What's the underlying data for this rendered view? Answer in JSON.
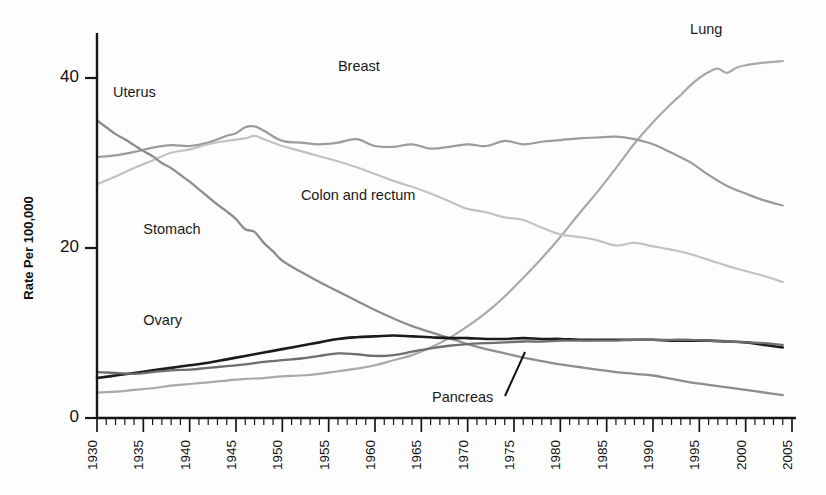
{
  "chart_data": {
    "type": "line",
    "title": "",
    "subtitle": "",
    "xlabel": "",
    "ylabel": "Rate Per 100,000",
    "xlim": [
      1930,
      2005
    ],
    "ylim": [
      0,
      45
    ],
    "yticks": [
      0,
      20,
      40
    ],
    "ytick_labels": [
      "0",
      "20",
      "40"
    ],
    "xticks": [
      1930,
      1935,
      1940,
      1945,
      1950,
      1955,
      1960,
      1965,
      1970,
      1975,
      1980,
      1985,
      1990,
      1995,
      2000,
      2005
    ],
    "xtick_labels": [
      "1930",
      "1935",
      "1940",
      "1945",
      "1950",
      "1955",
      "1960",
      "1965",
      "1970",
      "1975",
      "1980",
      "1985",
      "1990",
      "1995",
      "2000",
      "2005"
    ],
    "minor_tick_interval": 1,
    "grid": false,
    "legend": "inline-labels",
    "legend_position": "inline",
    "annotations": [
      {
        "text": "Pancreas",
        "leader_line": true
      }
    ],
    "series": [
      {
        "name": "Lung",
        "color": "#a9a9a9",
        "width": 2.2,
        "label_x": 1994,
        "label_y": 45.2,
        "x": [
          1930,
          1932,
          1934,
          1936,
          1938,
          1940,
          1942,
          1944,
          1946,
          1948,
          1950,
          1952,
          1954,
          1956,
          1958,
          1960,
          1962,
          1964,
          1966,
          1968,
          1970,
          1972,
          1974,
          1976,
          1978,
          1980,
          1982,
          1984,
          1986,
          1988,
          1990,
          1992,
          1993,
          1994,
          1995,
          1996,
          1997,
          1998,
          1999,
          2000,
          2002,
          2004
        ],
        "y": [
          3.0,
          3.1,
          3.3,
          3.5,
          3.8,
          4.0,
          4.2,
          4.4,
          4.6,
          4.7,
          4.9,
          5.0,
          5.2,
          5.5,
          5.8,
          6.2,
          6.8,
          7.4,
          8.3,
          9.4,
          10.8,
          12.4,
          14.3,
          16.5,
          18.8,
          21.3,
          24.0,
          26.6,
          29.4,
          32.3,
          34.8,
          37.0,
          38.0,
          39.1,
          40.0,
          40.7,
          41.1,
          40.6,
          41.2,
          41.5,
          41.8,
          42.0
        ]
      },
      {
        "name": "Breast",
        "color": "#9b9b9b",
        "width": 2.2,
        "label_x": 1956,
        "label_y": 40.8,
        "x": [
          1930,
          1932,
          1934,
          1936,
          1938,
          1940,
          1942,
          1944,
          1945,
          1946,
          1947,
          1948,
          1950,
          1952,
          1954,
          1956,
          1958,
          1960,
          1962,
          1964,
          1966,
          1968,
          1970,
          1972,
          1974,
          1976,
          1978,
          1980,
          1982,
          1984,
          1986,
          1988,
          1990,
          1992,
          1994,
          1996,
          1998,
          2000,
          2002,
          2004
        ],
        "y": [
          30.7,
          30.9,
          31.3,
          31.8,
          32.1,
          32.0,
          32.4,
          33.2,
          33.5,
          34.2,
          34.3,
          33.8,
          32.6,
          32.4,
          32.2,
          32.4,
          32.8,
          32.0,
          31.9,
          32.2,
          31.7,
          31.9,
          32.2,
          32.0,
          32.6,
          32.2,
          32.5,
          32.7,
          32.9,
          33.0,
          33.1,
          32.8,
          32.2,
          31.2,
          30.1,
          28.6,
          27.3,
          26.4,
          25.6,
          25.0
        ]
      },
      {
        "name": "Colon and rectum",
        "color": "#c2c2c2",
        "width": 2.2,
        "label_x": 1952,
        "label_y": 25.6,
        "x": [
          1930,
          1932,
          1934,
          1936,
          1938,
          1940,
          1942,
          1944,
          1946,
          1947,
          1948,
          1950,
          1952,
          1954,
          1956,
          1958,
          1960,
          1962,
          1964,
          1966,
          1968,
          1970,
          1972,
          1974,
          1976,
          1978,
          1980,
          1982,
          1984,
          1986,
          1988,
          1990,
          1992,
          1994,
          1996,
          1998,
          2000,
          2002,
          2004
        ],
        "y": [
          27.5,
          28.4,
          29.4,
          30.3,
          31.2,
          31.6,
          32.2,
          32.6,
          32.9,
          33.2,
          32.8,
          32.0,
          31.4,
          30.8,
          30.2,
          29.5,
          28.7,
          27.9,
          27.2,
          26.4,
          25.5,
          24.6,
          24.2,
          23.6,
          23.3,
          22.4,
          21.6,
          21.3,
          20.9,
          20.3,
          20.6,
          20.2,
          19.8,
          19.3,
          18.6,
          17.9,
          17.3,
          16.7,
          16.0
        ]
      },
      {
        "name": "Stomach",
        "color": "#8d8d8d",
        "width": 2.3,
        "label_x": 1935,
        "label_y": 21.6,
        "x": [
          1930,
          1931,
          1932,
          1933,
          1934,
          1935,
          1936,
          1937,
          1938,
          1939,
          1940,
          1941,
          1942,
          1943,
          1944,
          1945,
          1946,
          1947,
          1948,
          1949,
          1950,
          1952,
          1954,
          1956,
          1958,
          1960,
          1962,
          1964,
          1966,
          1968,
          1970,
          1972,
          1974,
          1976,
          1978,
          1980,
          1982,
          1984,
          1986,
          1988,
          1990,
          1992,
          1994,
          1996,
          1998,
          2000,
          2002,
          2004
        ],
        "y": [
          35.0,
          34.2,
          33.4,
          32.8,
          32.1,
          31.4,
          30.8,
          30.0,
          29.4,
          28.6,
          27.8,
          26.9,
          26.0,
          25.1,
          24.3,
          23.4,
          22.2,
          21.9,
          20.6,
          19.6,
          18.5,
          17.2,
          16.0,
          14.9,
          13.8,
          12.7,
          11.7,
          10.8,
          10.1,
          9.4,
          8.7,
          8.1,
          7.6,
          7.1,
          6.7,
          6.3,
          6.0,
          5.7,
          5.4,
          5.2,
          5.0,
          4.6,
          4.2,
          3.9,
          3.6,
          3.3,
          3.0,
          2.7
        ]
      },
      {
        "name": "Ovary",
        "color": "#1b1b1b",
        "width": 2.6,
        "label_x": 1935,
        "label_y": 10.9,
        "x": [
          1930,
          1932,
          1934,
          1936,
          1938,
          1940,
          1942,
          1944,
          1946,
          1948,
          1950,
          1952,
          1954,
          1956,
          1958,
          1960,
          1962,
          1964,
          1966,
          1968,
          1970,
          1972,
          1974,
          1976,
          1978,
          1980,
          1982,
          1984,
          1986,
          1988,
          1990,
          1992,
          1994,
          1996,
          1998,
          2000,
          2002,
          2004
        ],
        "y": [
          4.7,
          5.0,
          5.3,
          5.6,
          5.9,
          6.2,
          6.5,
          6.9,
          7.3,
          7.7,
          8.1,
          8.5,
          8.9,
          9.3,
          9.5,
          9.6,
          9.7,
          9.6,
          9.5,
          9.4,
          9.4,
          9.3,
          9.3,
          9.4,
          9.3,
          9.3,
          9.2,
          9.2,
          9.2,
          9.2,
          9.2,
          9.1,
          9.1,
          9.1,
          9.0,
          8.9,
          8.6,
          8.3
        ]
      },
      {
        "name": "Pancreas",
        "color": "#6e6e6e",
        "width": 2.3,
        "label_x": 1967,
        "label_y": 1.9,
        "x": [
          1930,
          1932,
          1934,
          1936,
          1938,
          1940,
          1942,
          1944,
          1946,
          1948,
          1950,
          1952,
          1954,
          1956,
          1958,
          1960,
          1962,
          1964,
          1966,
          1968,
          1970,
          1972,
          1974,
          1976,
          1978,
          1980,
          1982,
          1984,
          1986,
          1988,
          1990,
          1992,
          1994,
          1996,
          1998,
          2000,
          2002,
          2004
        ],
        "y": [
          5.4,
          5.3,
          5.2,
          5.4,
          5.6,
          5.7,
          5.9,
          6.1,
          6.3,
          6.6,
          6.8,
          7.0,
          7.3,
          7.6,
          7.5,
          7.3,
          7.4,
          7.8,
          8.2,
          8.5,
          8.7,
          8.8,
          8.9,
          9.0,
          9.0,
          9.1,
          9.1,
          9.1,
          9.1,
          9.2,
          9.2,
          9.2,
          9.2,
          9.1,
          9.0,
          8.9,
          8.8,
          8.6
        ]
      }
    ]
  },
  "labels": {
    "lung": "Lung",
    "breast": "Breast",
    "colon": "Colon and rectum",
    "stomach": "Stomach",
    "ovary": "Ovary",
    "uterus": "Uterus",
    "pancreas": "Pancreas"
  },
  "axis": {
    "y_title": "Rate Per 100,000",
    "y_0": "0",
    "y_20": "20",
    "y_40": "40",
    "x_1930": "1930",
    "x_1935": "1935",
    "x_1940": "1940",
    "x_1945": "1945",
    "x_1950": "1950",
    "x_1955": "1955",
    "x_1960": "1960",
    "x_1965": "1965",
    "x_1970": "1970",
    "x_1975": "1975",
    "x_1980": "1980",
    "x_1985": "1985",
    "x_1990": "1990",
    "x_1995": "1995",
    "x_2000": "2000",
    "x_2005": "2005"
  },
  "colors": {
    "axis": "#161616",
    "lung": "#a9a9a9",
    "breast": "#9b9b9b",
    "colon": "#c2c2c2",
    "stomach": "#8d8d8d",
    "ovary": "#1b1b1b",
    "pancreas": "#6e6e6e",
    "uterus": "#9b9b9b",
    "background": "#fdfdfd"
  }
}
